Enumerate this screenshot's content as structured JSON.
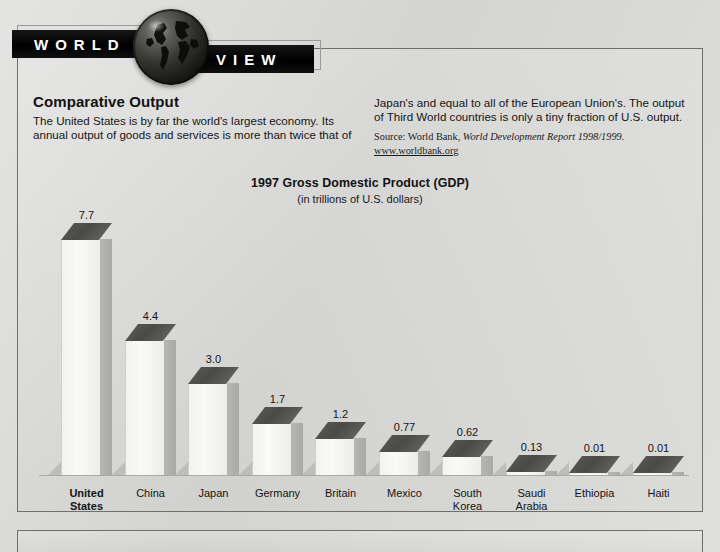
{
  "banner": {
    "word_left": "WORLD",
    "word_right": "VIEW",
    "globe_icon": "globe-icon"
  },
  "article": {
    "headline": "Comparative Output",
    "column_left": "The United States is by far the world's largest economy. Its annual output of goods and services is more than twice that of",
    "column_right": "Japan's and equal to all of the European Union's. The output of Third World countries is only a tiny fraction of U.S. output.",
    "source_prefix": "Source: World Bank, ",
    "source_italic": "World Development Report 1998/1999.",
    "source_link": "www.worldbank.org"
  },
  "chart_data": {
    "type": "bar",
    "title": "1997 Gross Domestic Product (GDP)",
    "subtitle": "(in trillions of U.S. dollars)",
    "xlabel": "",
    "ylabel": "Trillions of U.S. dollars",
    "ylim": [
      0,
      7.7
    ],
    "grid": false,
    "legend": "none",
    "categories": [
      "United States",
      "China",
      "Japan",
      "Germany",
      "Britain",
      "Mexico",
      "South Korea",
      "Saudi Arabia",
      "Ethiopia",
      "Haiti"
    ],
    "category_lines": [
      [
        "United",
        "States"
      ],
      [
        "China"
      ],
      [
        "Japan"
      ],
      [
        "Germany"
      ],
      [
        "Britain"
      ],
      [
        "Mexico"
      ],
      [
        "South",
        "Korea"
      ],
      [
        "Saudi",
        "Arabia"
      ],
      [
        "Ethiopia"
      ],
      [
        "Haiti"
      ]
    ],
    "values": [
      7.7,
      4.4,
      3.0,
      1.7,
      1.2,
      0.77,
      0.62,
      0.13,
      0.01,
      0.01
    ],
    "value_labels": [
      "7.7",
      "4.4",
      "3.0",
      "1.7",
      "1.2",
      "0.77",
      "0.62",
      "0.13",
      "0.01",
      "0.01"
    ],
    "emphasized_category": "United States"
  },
  "colors": {
    "page_background": "#d8d8d6",
    "banner_black": "#000000",
    "banner_text": "#ffffff",
    "bar_top_face": "#4f4f4d",
    "bar_front_face": "#f5f5f3",
    "bar_side_face": "#b0b0ad",
    "border": "#6e6e6c",
    "body_text": "#161616"
  }
}
